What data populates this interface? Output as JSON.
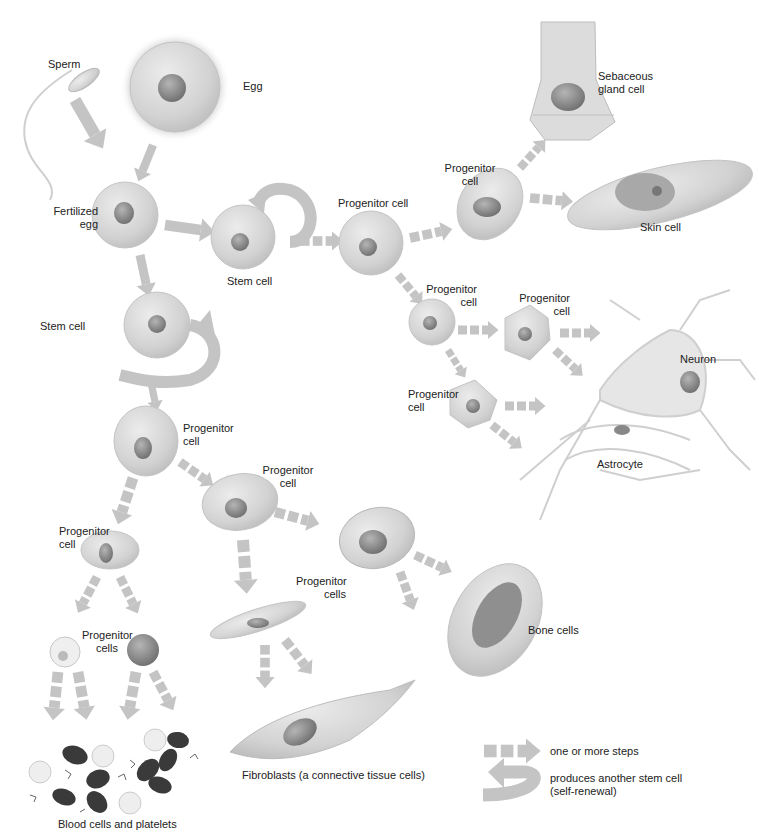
{
  "labels": {
    "sperm": "Sperm",
    "egg": "Egg",
    "fertilized_egg": [
      "Fertilized",
      "egg"
    ],
    "stem_cell_1": "Stem cell",
    "stem_cell_2": "Stem cell",
    "progenitor_cell_top": "Progenitor cell",
    "progenitor_cell_skin": [
      "Progenitor",
      "cell"
    ],
    "sebaceous": [
      "Sebaceous",
      "gland cell"
    ],
    "skin_cell": "Skin cell",
    "progenitor_neural_1": [
      "Progenitor",
      "cell"
    ],
    "progenitor_neural_2": [
      "Progenitor",
      "cell"
    ],
    "progenitor_neural_3": [
      "Progenitor",
      "cell"
    ],
    "neuron": "Neuron",
    "astrocyte": "Astrocyte",
    "progenitor_mid": [
      "Progenitor",
      "cell"
    ],
    "progenitor_connective": [
      "Progenitor",
      "cell"
    ],
    "progenitor_blood": [
      "Progenitor",
      "cell"
    ],
    "progenitor_cells_blood": [
      "Progenitor",
      "cells"
    ],
    "progenitor_cells_bone": [
      "Progenitor",
      "cells"
    ],
    "bone_cells": "Bone cells",
    "fibroblasts": "Fibroblasts (a connective tissue cells)",
    "blood_cells": "Blood cells and platelets"
  },
  "legend": {
    "dashed_arrow": "one or more steps",
    "curved_arrow": [
      "produces another stem cell",
      "(self-renewal)"
    ]
  },
  "colors": {
    "arrow": "#c4c4c4",
    "cell_fill": "#d6d6d6",
    "cell_stroke": "#b8b8b8",
    "nucleus": "#8c8c8c",
    "red_cell": "#3a3a3a",
    "text": "#222222"
  }
}
